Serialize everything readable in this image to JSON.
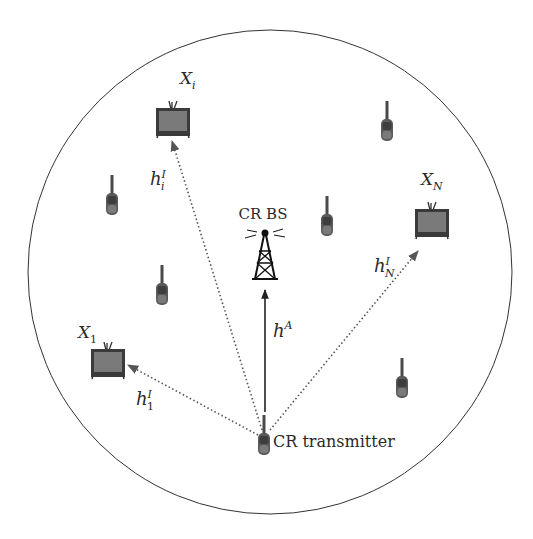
{
  "diagram": {
    "base_station": {
      "label": "CR BS",
      "icon": "cell-tower-icon"
    },
    "transmitter": {
      "label": "CR transmitter",
      "icon": "walkie-talkie-icon"
    },
    "primary_receivers": [
      {
        "id": "X1",
        "name": "X",
        "sub": "1",
        "icon": "tv-icon"
      },
      {
        "id": "Xi",
        "name": "X",
        "sub": "i",
        "icon": "tv-icon"
      },
      {
        "id": "XN",
        "name": "X",
        "sub": "N",
        "icon": "tv-icon"
      }
    ],
    "links": [
      {
        "id": "hA",
        "from": "CR transmitter",
        "to": "CR BS",
        "style": "solid",
        "base": "h",
        "sup": "A",
        "sub": ""
      },
      {
        "id": "h1I",
        "from": "CR transmitter",
        "to": "X1",
        "style": "dotted",
        "base": "h",
        "sup": "I",
        "sub": "1"
      },
      {
        "id": "hiI",
        "from": "CR transmitter",
        "to": "Xi",
        "style": "dotted",
        "base": "h",
        "sup": "I",
        "sub": "i"
      },
      {
        "id": "hNI",
        "from": "CR transmitter",
        "to": "XN",
        "style": "dotted",
        "base": "h",
        "sup": "I",
        "sub": "N"
      }
    ],
    "other_cr_users_count": 5,
    "colors": {
      "line": "#333333",
      "device": "#5a5a5a",
      "screen": "#6e6e6e"
    }
  }
}
